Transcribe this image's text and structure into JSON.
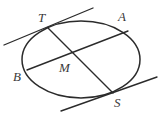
{
  "figure": {
    "kind": "circle-geometry-diagram",
    "background_color": "#ffffff",
    "stroke_color": "#2b2b2b",
    "label_color": "#3a3a3a",
    "labels": {
      "T": "T",
      "A": "A",
      "B": "B",
      "M": "M",
      "S": "S"
    },
    "label_positions": {
      "T": {
        "x": 38,
        "y": 11
      },
      "A": {
        "x": 118,
        "y": 10
      },
      "B": {
        "x": 13,
        "y": 70
      },
      "M": {
        "x": 59,
        "y": 61
      },
      "S": {
        "x": 114,
        "y": 96
      }
    },
    "ellipse": {
      "cx": 81,
      "cy": 59.5,
      "rx": 59,
      "ry": 38.5
    },
    "points": {
      "T": {
        "x": 48,
        "y": 28
      },
      "A": {
        "x": 128,
        "y": 31
      },
      "B": {
        "x": 27,
        "y": 70
      },
      "S": {
        "x": 113,
        "y": 93
      },
      "M": {
        "x": 72,
        "y": 52
      }
    },
    "chords": [
      {
        "name": "chord-TS",
        "from": "T",
        "to": "S"
      },
      {
        "name": "chord-BA",
        "from": "B",
        "to": "A"
      }
    ],
    "tangents": [
      {
        "name": "tangent-at-T",
        "x1": 4,
        "y1": 45,
        "x2": 93,
        "y2": 8
      },
      {
        "name": "tangent-at-S",
        "x1": 61,
        "y1": 111,
        "x2": 157,
        "y2": 77
      }
    ]
  }
}
